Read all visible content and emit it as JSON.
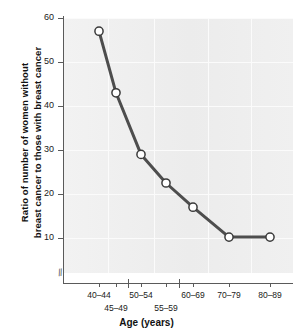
{
  "chart_data": {
    "type": "line",
    "title": "",
    "xlabel": "Age (years)",
    "ylabel_line1": "Ratio of number of women without",
    "ylabel_line2": "breast cancer to those with breast cancer",
    "categories": [
      "40–44",
      "45–49",
      "50–54",
      "55–59",
      "60–69",
      "70–79",
      "80–89"
    ],
    "values": [
      57,
      43,
      29,
      22.5,
      17,
      10.2,
      10.2
    ],
    "series": [
      {
        "name": "Ratio of women without breast cancer to those with breast cancer",
        "values": [
          57,
          43,
          29,
          22.5,
          17,
          10.2,
          10.2
        ]
      }
    ],
    "ylim": [
      5,
      60
    ],
    "yticks": [
      10,
      20,
      30,
      40,
      50,
      60
    ],
    "ytick_labels": [
      "10",
      "20",
      "30",
      "40",
      "50",
      "60"
    ],
    "grid": true,
    "legend": "none",
    "axis_break": "//",
    "marker": "open-circle",
    "line_color": "#4d4d4d",
    "marker_face_color": "#ffffff",
    "marker_edge_color": "#3a3a3a",
    "plot_background": "#efefef",
    "gridline_color": "#fbfbfb",
    "axis_color": "#5a5a5a"
  },
  "axis": {
    "x_tick_labels_row1": [
      "40–44",
      "50–54",
      "60–69",
      "70–79",
      "80–89"
    ],
    "x_tick_labels_row2": [
      "45–49",
      "55–59"
    ],
    "x_title": "Age (years)"
  }
}
